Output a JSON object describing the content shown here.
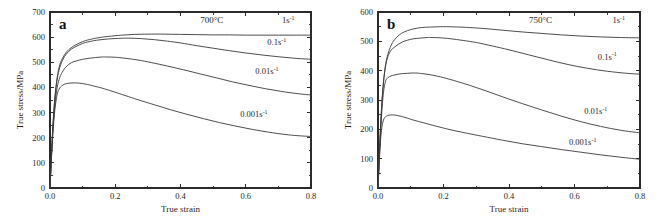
{
  "figure": {
    "background": "#ffffff",
    "curve_color": "#3a3a3a",
    "axis_color": "#2b2b2b"
  },
  "chart_data": [
    {
      "type": "line",
      "panel_label": "a",
      "title": "700°C",
      "xlabel": "True strain",
      "ylabel": "True stress/MPa",
      "xlim": [
        0.0,
        0.8
      ],
      "ylim": [
        0,
        700
      ],
      "xticks": [
        0.0,
        0.2,
        0.4,
        0.6,
        0.8
      ],
      "xticklabels": [
        "0.0",
        "0.2",
        "0.4",
        "0.6",
        "0.8"
      ],
      "xminorticks": [
        0.1,
        0.3,
        0.5,
        0.7
      ],
      "yticks": [
        0,
        100,
        200,
        300,
        400,
        500,
        600,
        700
      ],
      "yticklabels": [
        "0",
        "100",
        "200",
        "300",
        "400",
        "500",
        "600",
        "700"
      ],
      "grid": false,
      "legend": "inline-annotations",
      "series": [
        {
          "name": "1s-1",
          "label_base": "1s",
          "label_sup": "-1",
          "label_x": 0.73,
          "label_y": 655,
          "peak_stress": 612,
          "peak_strain": 0.3,
          "end_stress": 608,
          "x": [
            0.0,
            0.004,
            0.009,
            0.015,
            0.022,
            0.03,
            0.04,
            0.05,
            0.065,
            0.08,
            0.1,
            0.12,
            0.15,
            0.18,
            0.22,
            0.26,
            0.3,
            0.35,
            0.4,
            0.45,
            0.5,
            0.55,
            0.6,
            0.65,
            0.7,
            0.75,
            0.8
          ],
          "y": [
            0,
            120,
            250,
            360,
            440,
            490,
            520,
            540,
            558,
            570,
            582,
            590,
            598,
            603,
            608,
            611,
            612,
            612,
            611,
            610,
            609,
            609,
            608,
            608,
            608,
            608,
            608
          ]
        },
        {
          "name": "0.1s-1",
          "label_base": "0.1s",
          "label_sup": "-1",
          "label_x": 0.695,
          "label_y": 568,
          "peak_stress": 596,
          "peak_strain": 0.24,
          "end_stress": 512,
          "x": [
            0.0,
            0.004,
            0.009,
            0.015,
            0.022,
            0.03,
            0.04,
            0.05,
            0.065,
            0.08,
            0.1,
            0.12,
            0.15,
            0.18,
            0.21,
            0.24,
            0.28,
            0.32,
            0.36,
            0.4,
            0.45,
            0.5,
            0.55,
            0.6,
            0.65,
            0.7,
            0.75,
            0.8
          ],
          "y": [
            0,
            118,
            245,
            355,
            432,
            480,
            512,
            533,
            552,
            563,
            575,
            582,
            589,
            593,
            595,
            596,
            594,
            590,
            584,
            577,
            566,
            556,
            546,
            537,
            529,
            522,
            516,
            512
          ]
        },
        {
          "name": "0.01s-1",
          "label_base": "0.01s",
          "label_sup": "-1",
          "label_x": 0.665,
          "label_y": 452,
          "peak_stress": 521,
          "peak_strain": 0.175,
          "end_stress": 370,
          "x": [
            0.0,
            0.004,
            0.009,
            0.015,
            0.022,
            0.03,
            0.04,
            0.05,
            0.065,
            0.08,
            0.1,
            0.12,
            0.14,
            0.16,
            0.175,
            0.2,
            0.23,
            0.27,
            0.31,
            0.36,
            0.41,
            0.46,
            0.51,
            0.56,
            0.61,
            0.66,
            0.71,
            0.76,
            0.8
          ],
          "y": [
            0,
            112,
            232,
            332,
            400,
            440,
            466,
            483,
            498,
            505,
            512,
            516,
            519,
            521,
            521,
            520,
            516,
            509,
            499,
            485,
            470,
            454,
            438,
            422,
            408,
            395,
            384,
            375,
            370
          ]
        },
        {
          "name": "0.001s-1",
          "label_base": "0.001s",
          "label_sup": "-1",
          "label_x": 0.625,
          "label_y": 283,
          "peak_stress": 418,
          "peak_strain": 0.075,
          "end_stress": 205,
          "x": [
            0.0,
            0.004,
            0.009,
            0.015,
            0.022,
            0.03,
            0.04,
            0.05,
            0.06,
            0.075,
            0.09,
            0.11,
            0.13,
            0.16,
            0.19,
            0.23,
            0.27,
            0.32,
            0.37,
            0.42,
            0.47,
            0.52,
            0.57,
            0.62,
            0.67,
            0.72,
            0.76,
            0.8
          ],
          "y": [
            0,
            105,
            218,
            312,
            372,
            398,
            410,
            415,
            417,
            418,
            417,
            413,
            407,
            397,
            385,
            368,
            351,
            331,
            311,
            293,
            276,
            260,
            246,
            233,
            222,
            213,
            208,
            205
          ]
        }
      ]
    },
    {
      "type": "line",
      "panel_label": "b",
      "title": "750°C",
      "xlabel": "True strain",
      "ylabel": "True stress/MPa",
      "xlim": [
        0.0,
        0.8
      ],
      "ylim": [
        0,
        600
      ],
      "xticks": [
        0.0,
        0.2,
        0.4,
        0.6,
        0.8
      ],
      "xticklabels": [
        "0.0",
        "0.2",
        "0.4",
        "0.6",
        "0.8"
      ],
      "xminorticks": [
        0.1,
        0.3,
        0.5,
        0.7
      ],
      "yticks": [
        0,
        100,
        200,
        300,
        400,
        500,
        600
      ],
      "yticklabels": [
        "0",
        "100",
        "200",
        "300",
        "400",
        "500",
        "600"
      ],
      "grid": false,
      "legend": "inline-annotations",
      "series": [
        {
          "name": "1s-1",
          "label_base": "1s",
          "label_sup": "-1",
          "label_x": 0.735,
          "label_y": 562,
          "peak_stress": 550,
          "peak_strain": 0.2,
          "end_stress": 512,
          "x": [
            0.0,
            0.004,
            0.009,
            0.015,
            0.022,
            0.03,
            0.04,
            0.05,
            0.065,
            0.08,
            0.1,
            0.12,
            0.145,
            0.17,
            0.2,
            0.24,
            0.28,
            0.33,
            0.38,
            0.44,
            0.5,
            0.56,
            0.62,
            0.68,
            0.74,
            0.8
          ],
          "y": [
            0,
            112,
            235,
            340,
            412,
            455,
            486,
            505,
            522,
            532,
            540,
            545,
            548,
            549,
            550,
            549,
            547,
            543,
            538,
            532,
            527,
            522,
            518,
            515,
            513,
            512
          ]
        },
        {
          "name": "0.1s-1",
          "label_base": "0.1s",
          "label_sup": "-1",
          "label_x": 0.7,
          "label_y": 438,
          "peak_stress": 513,
          "peak_strain": 0.165,
          "end_stress": 388,
          "x": [
            0.0,
            0.004,
            0.009,
            0.015,
            0.022,
            0.03,
            0.04,
            0.05,
            0.062,
            0.075,
            0.09,
            0.11,
            0.13,
            0.15,
            0.165,
            0.19,
            0.22,
            0.26,
            0.3,
            0.35,
            0.4,
            0.46,
            0.52,
            0.58,
            0.64,
            0.7,
            0.76,
            0.8
          ],
          "y": [
            0,
            110,
            232,
            338,
            408,
            448,
            470,
            480,
            490,
            498,
            504,
            509,
            511,
            513,
            513,
            512,
            509,
            503,
            496,
            484,
            471,
            454,
            437,
            421,
            408,
            398,
            391,
            388
          ]
        },
        {
          "name": "0.01s-1",
          "label_base": "0.01s",
          "label_sup": "-1",
          "label_x": 0.665,
          "label_y": 252,
          "peak_stress": 392,
          "peak_strain": 0.115,
          "end_stress": 188,
          "x": [
            0.0,
            0.004,
            0.009,
            0.015,
            0.022,
            0.03,
            0.04,
            0.05,
            0.062,
            0.075,
            0.09,
            0.105,
            0.115,
            0.135,
            0.16,
            0.19,
            0.23,
            0.28,
            0.33,
            0.38,
            0.44,
            0.5,
            0.56,
            0.62,
            0.68,
            0.74,
            0.8
          ],
          "y": [
            0,
            100,
            212,
            308,
            360,
            376,
            382,
            385,
            388,
            390,
            391,
            392,
            392,
            390,
            386,
            379,
            367,
            350,
            331,
            311,
            288,
            266,
            245,
            226,
            210,
            197,
            188
          ]
        },
        {
          "name": "0.001s-1",
          "label_base": "0.001s",
          "label_sup": "-1",
          "label_x": 0.625,
          "label_y": 147,
          "peak_stress": 249,
          "peak_strain": 0.048,
          "end_stress": 98,
          "x": [
            0.0,
            0.004,
            0.009,
            0.015,
            0.022,
            0.03,
            0.04,
            0.048,
            0.06,
            0.075,
            0.09,
            0.11,
            0.14,
            0.18,
            0.22,
            0.27,
            0.32,
            0.38,
            0.44,
            0.5,
            0.56,
            0.62,
            0.68,
            0.74,
            0.8
          ],
          "y": [
            0,
            92,
            180,
            225,
            242,
            247,
            249,
            249,
            247,
            243,
            238,
            231,
            222,
            210,
            199,
            187,
            176,
            163,
            151,
            141,
            131,
            122,
            113,
            105,
            98
          ]
        }
      ]
    }
  ]
}
